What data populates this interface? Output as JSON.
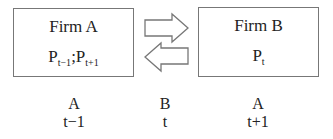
{
  "diagram": {
    "firm_a": {
      "title": "Firm A",
      "prices": [
        {
          "base": "P",
          "sub": "t−1"
        },
        {
          "sep": ";"
        },
        {
          "base": "P",
          "sub": "t+1"
        }
      ],
      "p1_base": "P",
      "p1_sub": "t−1",
      "separator": ";",
      "p2_base": "P",
      "p2_sub": "t+1"
    },
    "firm_b": {
      "title": "Firm B",
      "p_base": "P",
      "p_sub": "t"
    },
    "arrows": [
      {
        "direction": "right",
        "from": "Firm A",
        "to": "Firm B"
      },
      {
        "direction": "left",
        "from": "Firm B",
        "to": "Firm A"
      }
    ],
    "timeline": [
      {
        "firm": "A",
        "period": "t−1"
      },
      {
        "firm": "B",
        "period": "t"
      },
      {
        "firm": "A",
        "period": "t+1"
      }
    ],
    "colors": {
      "border": "#777777",
      "text": "#222222",
      "background": "#ffffff"
    }
  }
}
